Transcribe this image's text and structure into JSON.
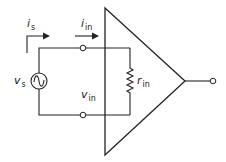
{
  "diagram": {
    "type": "circuit",
    "labels": {
      "source_current": {
        "main": "i",
        "sub": "s"
      },
      "input_current": {
        "main": "i",
        "sub": "in"
      },
      "source_voltage": {
        "main": "v",
        "sub": "s"
      },
      "input_voltage": {
        "main": "v",
        "sub": "in"
      },
      "input_resistance": {
        "main": "r",
        "sub": "in"
      }
    },
    "components": [
      "voltage-source-ac",
      "input-terminal-top",
      "input-terminal-bottom",
      "input-resistor",
      "amplifier",
      "output-terminal"
    ],
    "color": "#222222"
  }
}
